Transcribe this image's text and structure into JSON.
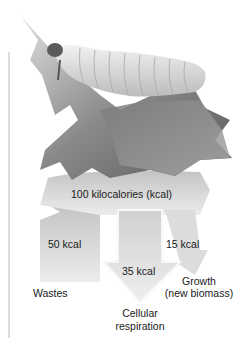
{
  "figure": {
    "input": {
      "label": "100 kilocalories (kcal)",
      "value": 100,
      "unit": "kcal"
    },
    "flows": [
      {
        "name": "wastes",
        "value_label": "50 kcal",
        "value": 50,
        "destination_label": "Wastes"
      },
      {
        "name": "cellular-respiration",
        "value_label": "35 kcal",
        "value": 35,
        "destination_label_line1": "Cellular",
        "destination_label_line2": "respiration"
      },
      {
        "name": "growth",
        "value_label": "15 kcal",
        "value": 15,
        "destination_label_line1": "Growth",
        "destination_label_line2": "(new biomass)"
      }
    ]
  },
  "colors": {
    "arrow_light": "#e8e8e8",
    "arrow_dark": "#bdbdbd",
    "leaf": "#6e6e6e",
    "caterpillar": "#d9d9d9",
    "axis_line": "#c8c8c8"
  }
}
